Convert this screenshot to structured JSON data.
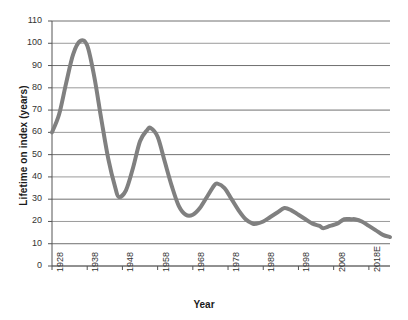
{
  "chart_data": {
    "type": "line",
    "title": "",
    "xlabel": "Year",
    "ylabel": "Lifetime on index (years)",
    "ylim": [
      0,
      110
    ],
    "ytick_step": 10,
    "yticks": [
      0,
      10,
      20,
      30,
      40,
      50,
      60,
      70,
      80,
      90,
      100,
      110
    ],
    "ytick_labels": [
      "0",
      "10",
      "20",
      "30",
      "40",
      "50",
      "60",
      "70",
      "80",
      "90",
      "100",
      "110"
    ],
    "xticks": [
      1928,
      1938,
      1948,
      1958,
      1968,
      1978,
      1988,
      1998,
      2008,
      2018
    ],
    "xtick_labels": [
      "1928",
      "1938",
      "1948",
      "1958",
      "1968",
      "1978",
      "1988",
      "1998",
      "2008",
      "2018E"
    ],
    "xlim": [
      1928,
      2024
    ],
    "grid": "horizontal",
    "legend": "none",
    "line_color": "#808080",
    "line_width": 4,
    "series": [
      {
        "name": "Lifetime on index",
        "x": [
          1928,
          1930,
          1932,
          1934,
          1936,
          1938,
          1940,
          1942,
          1944,
          1946,
          1947,
          1949,
          1951,
          1953,
          1955,
          1956,
          1958,
          1960,
          1962,
          1964,
          1966,
          1968,
          1970,
          1972,
          1974,
          1975,
          1977,
          1979,
          1981,
          1983,
          1985,
          1986,
          1988,
          1990,
          1992,
          1994,
          1996,
          1998,
          2000,
          2002,
          2004,
          2005,
          2007,
          2009,
          2011,
          2013,
          2014,
          2016,
          2018,
          2020,
          2022,
          2024
        ],
        "values": [
          60,
          68,
          82,
          95,
          101,
          99,
          85,
          66,
          48,
          35,
          31,
          34,
          44,
          56,
          61,
          62,
          58,
          47,
          36,
          27,
          23,
          23,
          26,
          31,
          36,
          37,
          35,
          30,
          25,
          21,
          19,
          19,
          20,
          22,
          24,
          26,
          25,
          23,
          21,
          19,
          18,
          17,
          18,
          19,
          21,
          21,
          21,
          20,
          18,
          16,
          14,
          13
        ]
      }
    ]
  },
  "axes": {
    "y_title": "Lifetime on index (years)",
    "x_title": "Year"
  }
}
